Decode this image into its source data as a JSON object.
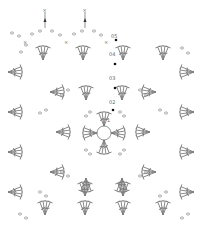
{
  "diagram": {
    "type": "crochet-chart",
    "round_labels": [
      "0",
      "1",
      "02",
      "03",
      "04",
      "05"
    ],
    "symbols": {
      "chain": "small oval",
      "double_crochet": "T with slash",
      "single_crochet": "x",
      "slip_stitch": "filled dot",
      "magic_ring": "circle",
      "join_arrow": "arrow up"
    },
    "colors": {
      "stroke": "#777777",
      "background": "#ffffff",
      "dot": "#111111"
    }
  }
}
